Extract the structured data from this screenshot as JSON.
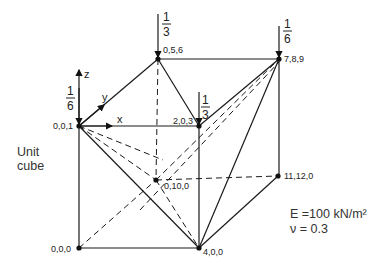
{
  "diagram": {
    "caption_left": [
      "Unit",
      "cube"
    ],
    "material": {
      "E_label": "E =100 kN/m²",
      "nu_label": "ν = 0.3"
    },
    "axes": {
      "z": "z",
      "y": "y",
      "x": "x"
    },
    "nodes": [
      {
        "label": "0,0,1",
        "x": 79,
        "y": 126
      },
      {
        "label": "0,5,6",
        "x": 158,
        "y": 59
      },
      {
        "label": "7,8,9",
        "x": 279,
        "y": 59
      },
      {
        "label": "2,0,3",
        "x": 199,
        "y": 126
      },
      {
        "label": "0,10,0",
        "x": 156,
        "y": 180
      },
      {
        "label": "11,12,0",
        "x": 278,
        "y": 176
      },
      {
        "label": "0,0,0",
        "x": 79,
        "y": 248
      },
      {
        "label": "4,0,0",
        "x": 199,
        "y": 248
      }
    ],
    "loads": [
      {
        "node": "0,0,1",
        "numerator": "1",
        "denominator": "6"
      },
      {
        "node": "0,5,6",
        "numerator": "1",
        "denominator": "3"
      },
      {
        "node": "2,0,3",
        "numerator": "1",
        "denominator": "3"
      },
      {
        "node": "7,8,9",
        "numerator": "1",
        "denominator": "6"
      }
    ]
  }
}
